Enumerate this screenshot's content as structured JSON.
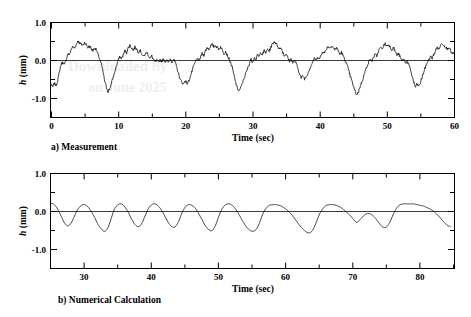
{
  "figure": {
    "background": "#ffffff",
    "line_color": "#111111",
    "axis_color": "#000000",
    "zero_line_color": "#3a3a3a"
  },
  "panels": [
    {
      "id": "a",
      "caption": "a) Measurement",
      "xlabel": "Time (sec)",
      "ylabel_italic": "h",
      "ylabel_rest": " (mm)"
    },
    {
      "id": "b",
      "caption": "b) Numerical Calculation",
      "xlabel": "Time (sec)",
      "ylabel_italic": "h",
      "ylabel_rest": " (mm)"
    }
  ],
  "chart_data": [
    {
      "type": "line",
      "title": "a) Measurement",
      "xlabel": "Time (sec)",
      "ylabel": "h (mm)",
      "xlim": [
        0,
        60
      ],
      "ylim": [
        -1.5,
        1.0
      ],
      "xticks": [
        0,
        10,
        20,
        30,
        40,
        50,
        60
      ],
      "xtick_labels": [
        "0",
        "10",
        "20",
        "30",
        "40",
        "50",
        "60"
      ],
      "xminor_step": 5,
      "yticks": [
        -1.0,
        0.0,
        1.0
      ],
      "ytick_labels": [
        "-1.0",
        "0.0",
        "1.0"
      ],
      "yminor_step": 0.5,
      "grid": false,
      "legend": null,
      "zero_reference_line": 0.0,
      "series": [
        {
          "name": "measured wave height",
          "x": [
            0.0,
            0.25,
            0.5,
            0.75,
            1.0,
            1.25,
            1.5,
            1.75,
            2.0,
            2.25,
            2.5,
            2.75,
            3.0,
            3.25,
            3.5,
            3.75,
            4.0,
            4.25,
            4.5,
            4.75,
            5.0,
            5.25,
            5.5,
            5.75,
            6.0,
            6.25,
            6.5,
            6.75,
            7.0,
            7.25,
            7.5,
            7.75,
            8.0,
            8.25,
            8.5,
            8.75,
            9.0,
            9.25,
            9.5,
            9.75,
            10.0,
            10.25,
            10.5,
            10.75,
            11.0,
            11.25,
            11.5,
            11.75,
            12.0,
            12.25,
            12.5,
            12.75,
            13.0,
            13.25,
            13.5,
            13.75,
            14.0,
            14.25,
            14.5,
            14.75,
            15.0,
            15.25,
            15.5,
            15.75,
            16.0,
            16.25,
            16.5,
            16.75,
            17.0,
            17.25,
            17.5,
            17.75,
            18.0,
            18.25,
            18.5,
            18.75,
            19.0,
            19.25,
            19.5,
            19.75,
            20.0,
            20.25,
            20.5,
            20.75,
            21.0,
            21.25,
            21.5,
            21.75,
            22.0,
            22.25,
            22.5,
            22.75,
            23.0,
            23.25,
            23.5,
            23.75,
            24.0,
            24.25,
            24.5,
            24.75,
            25.0,
            25.25,
            25.5,
            25.75,
            26.0,
            26.25,
            26.5,
            26.75,
            27.0,
            27.25,
            27.5,
            27.75,
            28.0,
            28.25,
            28.5,
            28.75,
            29.0,
            29.25,
            29.5,
            29.75,
            30.0,
            30.25,
            30.5,
            30.75,
            31.0,
            31.25,
            31.5,
            31.75,
            32.0,
            32.25,
            32.5,
            32.75,
            33.0,
            33.25,
            33.5,
            33.75,
            34.0,
            34.25,
            34.5,
            34.75,
            35.0,
            35.25,
            35.5,
            35.75,
            36.0,
            36.25,
            36.5,
            36.75,
            37.0,
            37.25,
            37.5,
            37.75,
            38.0,
            38.25,
            38.5,
            38.75,
            39.0,
            39.25,
            39.5,
            39.75,
            40.0,
            40.25,
            40.5,
            40.75,
            41.0,
            41.25,
            41.5,
            41.75,
            42.0,
            42.25,
            42.5,
            42.75,
            43.0,
            43.25,
            43.5,
            43.75,
            44.0,
            44.25,
            44.5,
            44.75,
            45.0,
            45.25,
            45.5,
            45.75,
            46.0,
            46.25,
            46.5,
            46.75,
            47.0,
            47.25,
            47.5,
            47.75,
            48.0,
            48.25,
            48.5,
            48.75,
            49.0,
            49.25,
            49.5,
            49.75,
            50.0,
            50.25,
            50.5,
            50.75,
            51.0,
            51.25,
            51.5,
            51.75,
            52.0,
            52.25,
            52.5,
            52.75,
            53.0,
            53.25,
            53.5,
            53.75,
            54.0,
            54.25,
            54.5,
            54.75,
            55.0,
            55.25,
            55.5,
            55.75,
            56.0,
            56.25,
            56.5,
            56.75,
            57.0,
            57.25,
            57.5,
            57.75,
            58.0,
            58.25,
            58.5,
            58.75,
            59.0,
            59.25,
            59.5,
            59.75,
            60.0
          ],
          "y": [
            -0.62,
            -0.7,
            -0.6,
            -0.66,
            -0.52,
            -0.3,
            -0.1,
            -0.04,
            -0.12,
            0.02,
            0.18,
            0.15,
            0.3,
            0.36,
            0.33,
            0.42,
            0.52,
            0.46,
            0.43,
            0.4,
            0.47,
            0.42,
            0.34,
            0.38,
            0.3,
            0.26,
            0.33,
            0.28,
            0.16,
            0.04,
            -0.1,
            -0.3,
            -0.55,
            -0.7,
            -0.82,
            -0.74,
            -0.6,
            -0.44,
            -0.3,
            -0.14,
            0.0,
            0.1,
            0.06,
            0.14,
            0.26,
            0.2,
            0.34,
            0.4,
            0.33,
            0.27,
            0.35,
            0.3,
            0.22,
            0.28,
            0.18,
            0.1,
            0.16,
            0.22,
            0.14,
            0.05,
            0.12,
            0.02,
            -0.04,
            0.0,
            -0.06,
            0.02,
            -0.02,
            0.04,
            -0.02,
            0.0,
            -0.05,
            0.04,
            -0.03,
            0.02,
            -0.06,
            -0.2,
            -0.36,
            -0.5,
            -0.58,
            -0.62,
            -0.52,
            -0.6,
            -0.55,
            -0.42,
            -0.28,
            -0.14,
            -0.04,
            0.06,
            -0.02,
            0.08,
            0.18,
            0.14,
            0.26,
            0.34,
            0.3,
            0.38,
            0.42,
            0.36,
            0.4,
            0.34,
            0.3,
            0.36,
            0.28,
            0.18,
            0.24,
            0.14,
            0.04,
            -0.06,
            -0.2,
            -0.4,
            -0.58,
            -0.74,
            -0.8,
            -0.72,
            -0.6,
            -0.46,
            -0.34,
            -0.22,
            -0.1,
            0.04,
            -0.04,
            0.08,
            0.02,
            0.14,
            0.1,
            0.22,
            0.16,
            0.26,
            0.2,
            0.3,
            0.24,
            0.36,
            0.44,
            0.5,
            0.45,
            0.38,
            0.3,
            0.34,
            0.22,
            0.12,
            0.18,
            0.08,
            -0.02,
            0.04,
            -0.06,
            0.0,
            -0.08,
            -0.2,
            -0.34,
            -0.46,
            -0.4,
            -0.48,
            -0.42,
            -0.34,
            -0.22,
            -0.12,
            -0.02,
            0.06,
            0.0,
            0.1,
            0.04,
            0.16,
            0.24,
            0.2,
            0.3,
            0.38,
            0.32,
            0.4,
            0.34,
            0.28,
            0.34,
            0.26,
            0.16,
            0.22,
            0.12,
            0.02,
            -0.08,
            -0.22,
            -0.38,
            -0.52,
            -0.66,
            -0.8,
            -0.9,
            -0.84,
            -0.7,
            -0.58,
            -0.44,
            -0.3,
            -0.16,
            -0.06,
            0.04,
            -0.02,
            0.08,
            0.16,
            0.12,
            0.24,
            0.34,
            0.3,
            0.38,
            0.44,
            0.38,
            0.42,
            0.36,
            0.28,
            0.34,
            0.24,
            0.14,
            0.18,
            0.08,
            -0.02,
            0.04,
            -0.06,
            -0.02,
            -0.1,
            -0.24,
            -0.4,
            -0.56,
            -0.7,
            -0.62,
            -0.68,
            -0.58,
            -0.44,
            -0.3,
            -0.18,
            -0.06,
            0.02,
            0.1,
            0.06,
            0.16,
            0.26,
            0.34,
            0.3,
            0.4,
            0.46,
            0.4,
            0.36,
            0.3,
            0.36,
            0.26,
            0.16,
            0.22,
            0.1,
            0.0,
            -0.1,
            -0.26,
            -0.44,
            -0.62,
            -0.78,
            -0.88,
            -0.8,
            -0.86,
            -0.78,
            -0.7
          ]
        }
      ]
    },
    {
      "type": "line",
      "title": "b) Numerical Calculation",
      "xlabel": "Time (sec)",
      "ylabel": "h (mm)",
      "xlim": [
        25,
        85
      ],
      "ylim": [
        -1.5,
        1.0
      ],
      "xticks": [
        30,
        40,
        50,
        60,
        70,
        80
      ],
      "xtick_labels": [
        "30",
        "40",
        "50",
        "60",
        "70",
        "80"
      ],
      "xminor_step": 5,
      "yticks": [
        -1.0,
        0.0,
        1.0
      ],
      "ytick_labels": [
        "-1.0",
        "0.0",
        "1.0"
      ],
      "yminor_step": 0.5,
      "grid": false,
      "legend": null,
      "zero_reference_line": 0.0,
      "series": [
        {
          "name": "computed wave height",
          "x": [
            25.0,
            25.5,
            26.0,
            26.5,
            27.0,
            27.5,
            28.0,
            28.5,
            29.0,
            29.5,
            30.0,
            30.5,
            31.0,
            31.5,
            32.0,
            32.5,
            33.0,
            33.5,
            34.0,
            34.5,
            35.0,
            35.5,
            36.0,
            36.5,
            37.0,
            37.5,
            38.0,
            38.5,
            39.0,
            39.5,
            40.0,
            40.5,
            41.0,
            41.5,
            42.0,
            42.5,
            43.0,
            43.5,
            44.0,
            44.5,
            45.0,
            45.5,
            46.0,
            46.5,
            47.0,
            47.5,
            48.0,
            48.5,
            49.0,
            49.5,
            50.0,
            50.5,
            51.0,
            51.5,
            52.0,
            52.5,
            53.0,
            53.5,
            54.0,
            54.5,
            55.0,
            55.5,
            56.0,
            56.5,
            57.0,
            57.5,
            58.0,
            58.5,
            59.0,
            59.5,
            60.0,
            60.5,
            61.0,
            61.5,
            62.0,
            62.5,
            63.0,
            63.5,
            64.0,
            64.5,
            65.0,
            65.5,
            66.0,
            66.5,
            67.0,
            67.5,
            68.0,
            68.5,
            69.0,
            69.5,
            70.0,
            70.5,
            71.0,
            71.5,
            72.0,
            72.5,
            73.0,
            73.5,
            74.0,
            74.5,
            75.0,
            75.5,
            76.0,
            76.5,
            77.0,
            77.5,
            78.0,
            78.5,
            79.0,
            79.5,
            80.0,
            80.5,
            81.0,
            81.5,
            82.0,
            82.5,
            83.0,
            83.5,
            84.0,
            84.5,
            85.0
          ],
          "y": [
            0.22,
            0.18,
            0.06,
            -0.12,
            -0.3,
            -0.38,
            -0.3,
            -0.12,
            0.06,
            0.16,
            0.18,
            0.12,
            0.0,
            -0.16,
            -0.34,
            -0.46,
            -0.52,
            -0.42,
            -0.16,
            0.08,
            0.18,
            0.2,
            0.12,
            -0.02,
            -0.2,
            -0.34,
            -0.4,
            -0.32,
            -0.12,
            0.08,
            0.18,
            0.2,
            0.14,
            0.02,
            -0.14,
            -0.3,
            -0.4,
            -0.4,
            -0.26,
            -0.04,
            0.12,
            0.18,
            0.16,
            0.08,
            -0.06,
            -0.22,
            -0.38,
            -0.48,
            -0.5,
            -0.36,
            -0.12,
            0.08,
            0.18,
            0.2,
            0.16,
            0.06,
            -0.08,
            -0.24,
            -0.38,
            -0.48,
            -0.52,
            -0.48,
            -0.32,
            -0.08,
            0.08,
            0.16,
            0.18,
            0.18,
            0.16,
            0.12,
            0.06,
            -0.02,
            -0.12,
            -0.24,
            -0.36,
            -0.46,
            -0.54,
            -0.56,
            -0.48,
            -0.28,
            -0.06,
            0.08,
            0.16,
            0.18,
            0.18,
            0.16,
            0.12,
            0.06,
            -0.02,
            -0.1,
            -0.2,
            -0.28,
            -0.22,
            -0.12,
            -0.06,
            -0.06,
            -0.12,
            -0.22,
            -0.34,
            -0.42,
            -0.4,
            -0.26,
            -0.06,
            0.1,
            0.18,
            0.2,
            0.2,
            0.2,
            0.2,
            0.18,
            0.16,
            0.14,
            0.1,
            0.06,
            0.0,
            -0.08,
            -0.18,
            -0.28,
            -0.36,
            -0.4
          ]
        }
      ]
    }
  ]
}
